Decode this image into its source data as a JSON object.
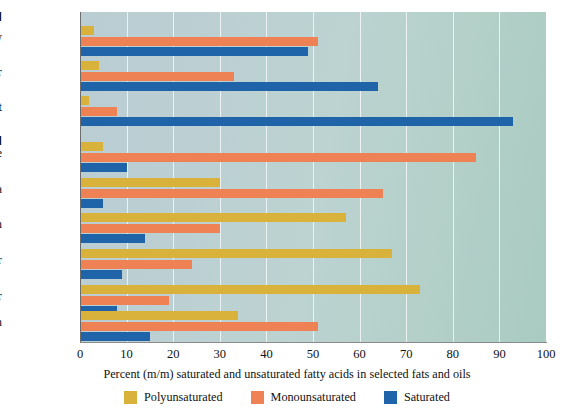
{
  "chart_data": {
    "type": "bar",
    "orientation": "horizontal",
    "title": "",
    "xlabel": "Percent (m/m) saturated and unsaturated fatty acids in selected fats and oils",
    "ylabel": "",
    "xlim": [
      0,
      100
    ],
    "xticks": [
      0,
      10,
      20,
      30,
      40,
      50,
      60,
      70,
      80,
      90,
      100
    ],
    "xtick_labels": [
      "0",
      "10",
      "20",
      "30",
      "40",
      "50",
      "60",
      "70",
      "80",
      "90",
      "100"
    ],
    "grid": "vertical-white",
    "legend_position": "bottom",
    "groups": [
      {
        "heading": "Solid",
        "categories": [
          "Beef tallow",
          "Butter",
          "Coconut"
        ]
      },
      {
        "heading": "Liquid",
        "categories": [
          "Olive",
          "Canola",
          "Soybean",
          "Sunflower",
          "Safflower",
          "Corn"
        ]
      }
    ],
    "categories": [
      "Beef tallow",
      "Butter",
      "Coconut",
      "Olive",
      "Canola",
      "Soybean",
      "Sunflower",
      "Safflower",
      "Corn"
    ],
    "series": [
      {
        "name": "Polyunsaturated",
        "color": "#d9b23c",
        "values": [
          3,
          4,
          2,
          5,
          30,
          57,
          67,
          73,
          34
        ]
      },
      {
        "name": "Monounsaturated",
        "color": "#ef8254",
        "values": [
          51,
          33,
          8,
          85,
          65,
          30,
          24,
          19,
          51
        ]
      },
      {
        "name": "Saturated",
        "color": "#1f63a8",
        "values": [
          49,
          64,
          93,
          10,
          5,
          14,
          9,
          8,
          15
        ]
      }
    ]
  },
  "legend": {
    "items": [
      {
        "label": "Polyunsaturated",
        "color": "#d9b23c"
      },
      {
        "label": "Monounsaturated",
        "color": "#ef8254"
      },
      {
        "label": "Saturated",
        "color": "#1f63a8"
      }
    ]
  }
}
